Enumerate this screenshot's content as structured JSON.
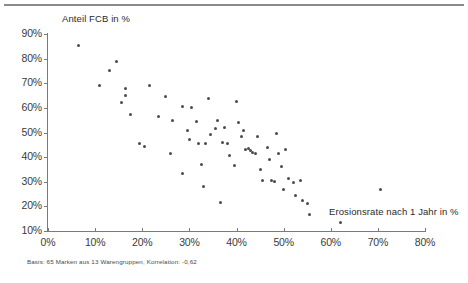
{
  "axis_titles": {
    "y": "Anteil FCB in %",
    "x": "Erosionsrate nach 1 Jahr in %"
  },
  "footnote": "Basis: 65 Marken aus 13 Warengruppen,  Korrelation: -0,62",
  "colors": {
    "point": "#4a4a52",
    "axis": "#7a7a7a",
    "rule": "#8a8a8a",
    "text": "#3a3a3a"
  },
  "chart_data": {
    "type": "scatter",
    "title": "",
    "xlabel": "Erosionsrate nach 1 Jahr in %",
    "ylabel": "Anteil FCB in %",
    "xlim": [
      0,
      80
    ],
    "ylim": [
      10,
      90
    ],
    "xticks": [
      "0%",
      "10%",
      "20%",
      "30%",
      "40%",
      "50%",
      "60%",
      "70%",
      "80%"
    ],
    "xtick_values": [
      0,
      10,
      20,
      30,
      40,
      50,
      60,
      70,
      80
    ],
    "yticks": [
      "10%",
      "20%",
      "30%",
      "40%",
      "50%",
      "60%",
      "70%",
      "80%",
      "90%"
    ],
    "ytick_values": [
      10,
      20,
      30,
      40,
      50,
      60,
      70,
      80,
      90
    ],
    "grid": false,
    "legend": null,
    "n_points": 65,
    "correlation": -0.62,
    "basis": "65 Marken aus 13 Warengruppen",
    "points": [
      [
        6.5,
        85.5
      ],
      [
        11.0,
        69.0
      ],
      [
        13.0,
        75.0
      ],
      [
        14.5,
        79.0
      ],
      [
        16.5,
        68.0
      ],
      [
        16.5,
        65.0
      ],
      [
        15.5,
        62.0
      ],
      [
        17.5,
        57.5
      ],
      [
        19.5,
        45.5
      ],
      [
        20.5,
        44.5
      ],
      [
        21.5,
        69.0
      ],
      [
        23.5,
        56.5
      ],
      [
        25.0,
        64.5
      ],
      [
        26.0,
        41.5
      ],
      [
        26.5,
        55.0
      ],
      [
        28.5,
        60.5
      ],
      [
        28.5,
        33.5
      ],
      [
        29.5,
        51.0
      ],
      [
        30.0,
        47.0
      ],
      [
        30.5,
        60.0
      ],
      [
        31.5,
        54.5
      ],
      [
        32.0,
        45.5
      ],
      [
        32.5,
        37.0
      ],
      [
        33.0,
        28.0
      ],
      [
        33.5,
        45.5
      ],
      [
        34.0,
        64.0
      ],
      [
        34.5,
        49.0
      ],
      [
        35.5,
        51.5
      ],
      [
        36.0,
        55.0
      ],
      [
        36.5,
        21.5
      ],
      [
        37.0,
        46.0
      ],
      [
        37.5,
        52.0
      ],
      [
        38.0,
        45.5
      ],
      [
        38.5,
        40.5
      ],
      [
        39.5,
        36.5
      ],
      [
        40.0,
        62.5
      ],
      [
        40.5,
        54.0
      ],
      [
        41.0,
        48.5
      ],
      [
        41.5,
        51.0
      ],
      [
        42.0,
        43.0
      ],
      [
        42.5,
        43.5
      ],
      [
        43.0,
        42.5
      ],
      [
        43.5,
        42.0
      ],
      [
        44.0,
        41.5
      ],
      [
        44.5,
        48.5
      ],
      [
        45.0,
        35.0
      ],
      [
        45.5,
        30.5
      ],
      [
        46.5,
        44.0
      ],
      [
        47.0,
        39.0
      ],
      [
        47.5,
        30.5
      ],
      [
        48.0,
        30.0
      ],
      [
        48.5,
        49.5
      ],
      [
        49.0,
        41.5
      ],
      [
        49.5,
        36.0
      ],
      [
        50.0,
        27.0
      ],
      [
        50.5,
        43.0
      ],
      [
        51.0,
        31.5
      ],
      [
        52.0,
        29.5
      ],
      [
        52.5,
        24.5
      ],
      [
        53.5,
        30.5
      ],
      [
        54.0,
        22.5
      ],
      [
        55.0,
        21.0
      ],
      [
        55.5,
        16.5
      ],
      [
        62.0,
        13.5
      ],
      [
        70.5,
        27.0
      ]
    ]
  }
}
